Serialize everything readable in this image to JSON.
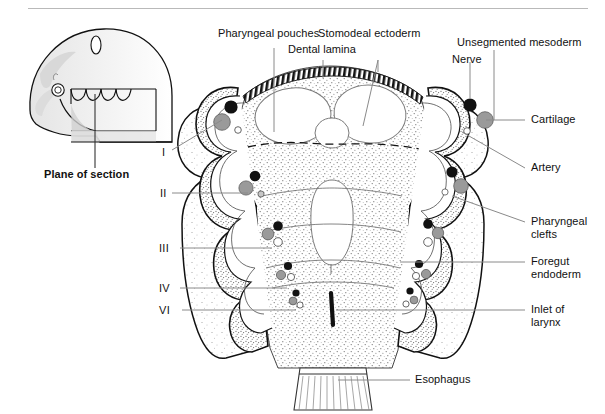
{
  "figure": {
    "domain": "anatomical-diagram",
    "background_color": "#ffffff",
    "ink_color": "#111111",
    "leader_line_color": "#8a8a8a",
    "cartilage_fill": "#9a9a9a",
    "nerve_fill": "#101010",
    "artery_fill": "#ffffff",
    "stipple_color": "#6e6e6e",
    "rule": {
      "visible": true,
      "color": "#b9b9b9"
    }
  },
  "inset": {
    "name": "embryo-head-profile",
    "caption": "Plane of section",
    "caption_bold": true,
    "features": [
      "cranium",
      "otic-vesicle",
      "eye",
      "pharyngeal-arch-grooves",
      "section-plane-block"
    ]
  },
  "labels": {
    "top": [
      {
        "id": "pharyngeal-pouches",
        "text": "Pharyngeal pouches"
      },
      {
        "id": "dental-lamina",
        "text": "Dental lamina"
      },
      {
        "id": "stomodeal-ectoderm",
        "text": "Stomodeal ectoderm"
      },
      {
        "id": "unsegmented-mesoderm",
        "text": "Unsegmented mesoderm"
      },
      {
        "id": "nerve",
        "text": "Nerve"
      }
    ],
    "right": [
      {
        "id": "cartilage",
        "text": "Cartilage"
      },
      {
        "id": "artery",
        "text": "Artery"
      },
      {
        "id": "pharyngeal-clefts",
        "text": "Pharyngeal",
        "text2": "clefts"
      },
      {
        "id": "foregut-endoderm",
        "text": "Foregut",
        "text2": "endoderm"
      },
      {
        "id": "inlet-of-larynx",
        "text": "Inlet of",
        "text2": "larynx"
      }
    ],
    "bottom": [
      {
        "id": "esophagus",
        "text": "Esophagus"
      }
    ],
    "arches": [
      {
        "id": "arch-1",
        "text": "I"
      },
      {
        "id": "arch-2",
        "text": "II"
      },
      {
        "id": "arch-3",
        "text": "III"
      },
      {
        "id": "arch-4",
        "text": "IV"
      },
      {
        "id": "arch-6",
        "text": "VI"
      }
    ]
  }
}
